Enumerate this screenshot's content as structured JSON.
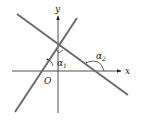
{
  "diagram": {
    "type": "coordinate-geometry",
    "axes": {
      "x_label": "x",
      "y_label": "y",
      "origin_label": "O"
    },
    "lines": [
      {
        "name": "line-1",
        "slope": "positive",
        "from": [
          15,
          112
        ],
        "to": [
          77,
          18
        ]
      },
      {
        "name": "line-2",
        "slope": "negative",
        "from": [
          17,
          14
        ],
        "to": [
          128,
          95
        ]
      }
    ],
    "angles": [
      {
        "label": "α",
        "subscript": "1"
      },
      {
        "label": "α",
        "subscript": "2"
      }
    ],
    "right_angle_mark": true,
    "colors": {
      "lines": "#6b6b6b",
      "axes": "#222222"
    }
  }
}
